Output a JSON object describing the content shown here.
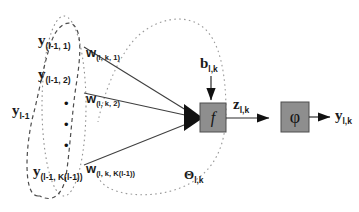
{
  "diagram": {
    "colors": {
      "line": "#3a3a3a",
      "dotted": "#8c8c8c",
      "dashed": "#4d4d4d",
      "box_fill": "#8e8e8e",
      "box_stroke": "#4a4a4a",
      "text": "#1a1a1a"
    },
    "inputs": {
      "group_label": {
        "base": "y",
        "sub": "l-1"
      },
      "nodes": [
        {
          "base": "y",
          "sub": "(l-1, 1)"
        },
        {
          "base": "y",
          "sub": "(l-1, 2)"
        },
        {
          "base": "y",
          "sub": "(l-1, K(l-1))"
        }
      ],
      "vertical_dots": "•"
    },
    "weights": [
      {
        "base": "w",
        "sub": "(l, k, 1)"
      },
      {
        "base": "w",
        "sub": "(l, k, 2)"
      },
      {
        "base": "w",
        "sub": "(l, k, K(l-1))"
      }
    ],
    "bias": {
      "base": "b",
      "sub": "l,k"
    },
    "summation_box": {
      "symbol": "f",
      "name": "transfer-function"
    },
    "net_input": {
      "base": "z",
      "sub": "l,k"
    },
    "activation_box": {
      "symbol": "φ",
      "name": "activation-function"
    },
    "output": {
      "base": "y",
      "sub": "l,k"
    },
    "parameter_group": {
      "base": "Θ",
      "sub": "l,k"
    }
  }
}
